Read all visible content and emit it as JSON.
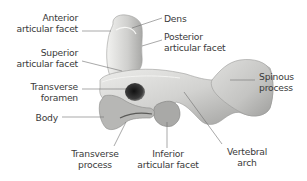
{
  "figure": {
    "colors": {
      "background": "#ffffff",
      "bone_light": "#e6e6e4",
      "bone_mid": "#bdbdbb",
      "bone_dark": "#7d7d7b",
      "foramen": "#2a2a2a",
      "leader_line": "#6e6e6e",
      "label_text": "#3a3a3a"
    },
    "labels": {
      "anterior_articular_facet": [
        "Anterior",
        "articular facet"
      ],
      "dens": [
        "Dens"
      ],
      "posterior_articular_facet": [
        "Posterior",
        "articular facet"
      ],
      "superior_articular_facet": [
        "Superior",
        "articular facet"
      ],
      "transverse_foramen": [
        "Transverse",
        "foramen"
      ],
      "spinous_process": [
        "Spinous",
        "process"
      ],
      "body": [
        "Body"
      ],
      "transverse_process": [
        "Transverse",
        "process"
      ],
      "inferior_articular_facet": [
        "Inferior",
        "articular facet"
      ],
      "vertebral_arch": [
        "Vertebral",
        "arch"
      ]
    }
  }
}
